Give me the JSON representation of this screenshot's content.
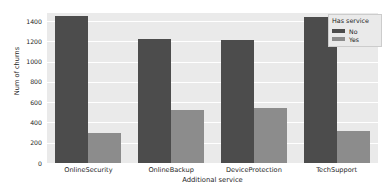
{
  "chart_data": {
    "type": "bar",
    "title": "",
    "xlabel": "Additional service",
    "ylabel": "Num of churns",
    "categories": [
      "OnlineSecurity",
      "OnlineBackup",
      "DeviceProtection",
      "TechSupport"
    ],
    "series": [
      {
        "name": "No",
        "values": [
          1450,
          1220,
          1210,
          1440
        ],
        "color": "#4c4c4c"
      },
      {
        "name": "Yes",
        "values": [
          300,
          520,
          540,
          320
        ],
        "color": "#8c8c8c"
      }
    ],
    "legend": {
      "title": "Has service",
      "position": "upper-right",
      "entries": [
        "No",
        "Yes"
      ]
    },
    "ylim": [
      0,
      1480
    ],
    "yticks": [
      0,
      200,
      400,
      600,
      800,
      1000,
      1200,
      1400
    ],
    "ytick_labels": [
      "0",
      "200",
      "400",
      "600",
      "800",
      "1000",
      "1200",
      "1400"
    ],
    "grid": "horizontal-white",
    "panel_background": "#eaeaea",
    "figure_background": "#ffffff"
  }
}
